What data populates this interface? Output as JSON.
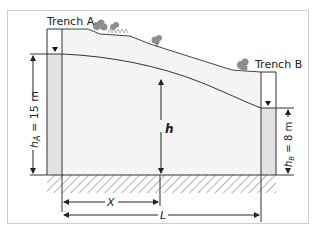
{
  "figure": {
    "trench_a_label": "Trench A",
    "trench_b_label": "Trench B",
    "h_label": "h",
    "h_a_label": "h",
    "h_a_sub": "A",
    "h_a_value": " = 15 m",
    "h_b_label": "h",
    "h_b_sub": "B",
    "h_b_value": " = 8 m",
    "x_label": "X",
    "l_label": "L",
    "colors": {
      "border": "#c8c8c8",
      "line": "#333333",
      "soil_fill": "#f2f2f2",
      "trench_water": "#e0e0e0",
      "hatch": "#999999",
      "vegetation": "#8a8a8a"
    }
  }
}
